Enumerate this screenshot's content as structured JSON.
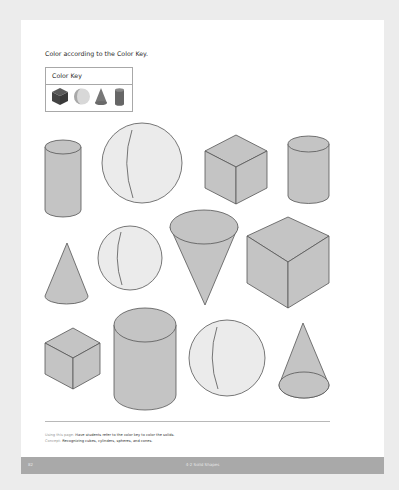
{
  "page": {
    "instruction": "Color according to the Color Key.",
    "color_key": {
      "title": "Color Key",
      "items": [
        {
          "shape": "cube",
          "icon": "cube-icon",
          "color": "#4a4a4a"
        },
        {
          "shape": "sphere",
          "icon": "sphere-icon",
          "color": "#c8c8c8"
        },
        {
          "shape": "cone",
          "icon": "cone-icon",
          "color": "#7a7a7a"
        },
        {
          "shape": "cylinder",
          "icon": "cylinder-icon",
          "color": "#6a6a6a"
        }
      ]
    },
    "shapes": [
      {
        "row": 1,
        "type": "cylinder"
      },
      {
        "row": 1,
        "type": "sphere"
      },
      {
        "row": 1,
        "type": "cube"
      },
      {
        "row": 1,
        "type": "cylinder"
      },
      {
        "row": 2,
        "type": "cone"
      },
      {
        "row": 2,
        "type": "sphere"
      },
      {
        "row": 2,
        "type": "cone"
      },
      {
        "row": 2,
        "type": "cube"
      },
      {
        "row": 3,
        "type": "cube"
      },
      {
        "row": 3,
        "type": "cylinder"
      },
      {
        "row": 3,
        "type": "sphere"
      },
      {
        "row": 3,
        "type": "cone"
      }
    ],
    "notes": {
      "using_label": "Using this page:",
      "using_text": "Have students refer to the color key to color the solids.",
      "concept_label": "Concept:",
      "concept_text": "Recognizing cubes, cylinders, spheres, and cones."
    },
    "footer": {
      "page_number": "82",
      "lesson": "4-2  Solid Shapes"
    },
    "colors": {
      "background": "#ececec",
      "page": "#ffffff",
      "shape_fill": "#c4c4c4",
      "sphere_fill": "#ebebeb",
      "outline": "#555555",
      "footer_bar": "#a9a9a9"
    }
  }
}
